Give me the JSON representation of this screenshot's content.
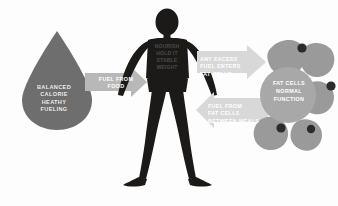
{
  "diagram": {
    "background_color": "#fdfdfd"
  },
  "droplet": {
    "name": "balanced-calorie-droplet",
    "label": "BALANCED\nCALORIE\nHEATHY\nFUELING",
    "fill": "#6e6e6e",
    "text_color": "#f2f2f2"
  },
  "figure": {
    "name": "human-body-silhouette",
    "fill": "#1c1a18",
    "torso_label": "NOURISH\nHOLD IT\nSTABLE\nWEIGHT",
    "torso_text_color": "#4a4a4a"
  },
  "arrows": [
    {
      "name": "arrow-fuel-from-food",
      "label": "FUEL FROM\nFOOD",
      "direction": "right",
      "fill": "#b8b8b8",
      "text_color": "#ffffff"
    },
    {
      "name": "arrow-excess-fuel",
      "label": "ANY EXCESS\nFUEL ENTERS\nFAT CELLS",
      "direction": "right",
      "fill": "#d8d8d8",
      "text_color": "#ffffff"
    },
    {
      "name": "arrow-fuel-between-meals",
      "label": "FUEL FROM\nFAT CELLS\nBETWEEN MEALS",
      "direction": "left",
      "fill": "#d8d8d8",
      "text_color": "#ffffff"
    }
  ],
  "fat_cells": {
    "name": "fat-cell-cluster",
    "center_label": "FAT CELLS\nNORMAL\nFUNCTION",
    "blob_fill": "#9a9a9a",
    "circle_fill": "#a8a8a8",
    "nucleus_fill": "#2b2b2b",
    "text_color": "#ffffff",
    "nuclei_count": 4
  },
  "colors": {
    "dark": "#1c1a18",
    "mid_gray": "#6e6e6e",
    "light_gray": "#b8b8b8",
    "pale_gray": "#d8d8d8",
    "blob_gray": "#9a9a9a"
  }
}
